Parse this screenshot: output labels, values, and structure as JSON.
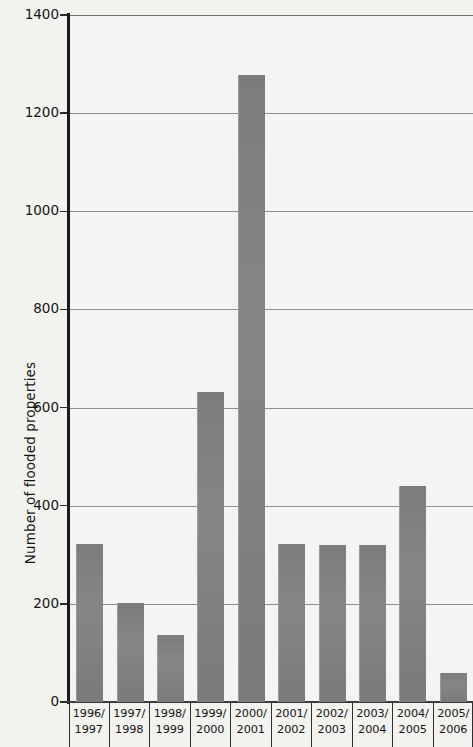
{
  "chart_data": {
    "type": "bar",
    "title": "",
    "subtitle": "",
    "xlabel": "",
    "ylabel": "Number of flooded properties",
    "categories": [
      "1996/\n1997",
      "1997/\n1998",
      "1998/\n1999",
      "1999/\n2000",
      "2000/\n2001",
      "2001/\n2002",
      "2002/\n2003",
      "2003/\n2004",
      "2004/\n2005",
      "2005/\n2006"
    ],
    "category_lines": [
      [
        "1996/",
        "1997"
      ],
      [
        "1997/",
        "1998"
      ],
      [
        "1998/",
        "1999"
      ],
      [
        "1999/",
        "2000"
      ],
      [
        "2000/",
        "2001"
      ],
      [
        "2001/",
        "2002"
      ],
      [
        "2002/",
        "2003"
      ],
      [
        "2003/",
        "2004"
      ],
      [
        "2004/",
        "2005"
      ],
      [
        "2005/",
        "2006"
      ]
    ],
    "values": [
      322,
      202,
      136,
      632,
      1278,
      322,
      320,
      320,
      440,
      59
    ],
    "ylim": [
      0,
      1400
    ],
    "ytick_values": [
      0,
      200,
      400,
      600,
      800,
      1000,
      1200,
      1400
    ],
    "ytick_labels": [
      "0",
      "200",
      "400",
      "600",
      "800",
      "1000",
      "1200",
      "1400"
    ],
    "grid": true,
    "legend": false,
    "legend_position": "none",
    "bar_color": "#7f7f7f",
    "plot_background": "#f4f4f2",
    "page_background": "#f2f2ef",
    "axis_color": "#1c1c1c",
    "gridline_color": "#8e8e8e"
  }
}
